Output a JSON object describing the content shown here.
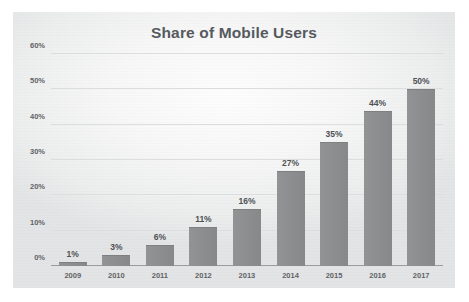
{
  "chart_data": {
    "type": "bar",
    "title": "Share of Mobile Users",
    "xlabel": "",
    "ylabel": "",
    "categories": [
      "2009",
      "2010",
      "2011",
      "2012",
      "2013",
      "2014",
      "2015",
      "2016",
      "2017"
    ],
    "values": [
      1,
      3,
      6,
      11,
      16,
      27,
      35,
      44,
      50
    ],
    "value_labels": [
      "1%",
      "3%",
      "6%",
      "11%",
      "16%",
      "27%",
      "35%",
      "44%",
      "50%"
    ],
    "ylim": [
      0,
      60
    ],
    "yticks": [
      0,
      10,
      20,
      30,
      40,
      50,
      60
    ],
    "ytick_labels": [
      "0%",
      "10%",
      "20%",
      "30%",
      "40%",
      "50%",
      "60%"
    ],
    "grid": true,
    "legend": false,
    "colors": {
      "bar": "#8d8e90",
      "title_text": "#565a5e",
      "tick_text": "#5f6366",
      "value_label_text": "#4e5255",
      "gridline": "#dcdddd",
      "axis_line": "#9a9c9e",
      "plot_background": "#f2f3f3",
      "page_background": "#ffffff"
    }
  }
}
